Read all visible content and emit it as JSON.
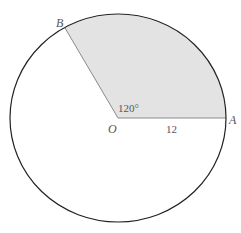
{
  "diagram": {
    "center_label": "O",
    "point_a_label": "A",
    "point_b_label": "B",
    "angle_label": "120°",
    "radius_label": "12",
    "colors": {
      "sector_fill": "#e3e3e3",
      "outline": "#222222",
      "radius_line": "#8a8a8a"
    }
  }
}
